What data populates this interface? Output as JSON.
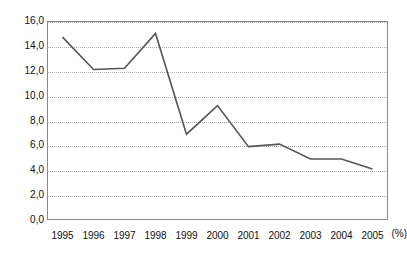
{
  "chart_data": {
    "type": "line",
    "title": "",
    "subtitle": "",
    "xlabel": "",
    "ylabel": "(%)",
    "grid": true,
    "legend": false,
    "legend_position": "none",
    "line_color": "#555555",
    "gridline_color": "#b0b0b0",
    "frame_color": "#8a8a8a",
    "categories": [
      "1995",
      "1996",
      "1997",
      "1998",
      "1999",
      "2000",
      "2001",
      "2002",
      "2003",
      "2004",
      "2005"
    ],
    "x": [
      1995,
      1996,
      1997,
      1998,
      1999,
      2000,
      2001,
      2002,
      2003,
      2004,
      2005
    ],
    "series": [
      {
        "name": "",
        "values": [
          14.7,
          12.1,
          12.2,
          15.0,
          6.9,
          9.2,
          5.9,
          6.1,
          4.9,
          4.9,
          4.1
        ]
      }
    ],
    "ylim": [
      0.0,
      16.0
    ],
    "ytick_values": [
      16.0,
      14.0,
      12.0,
      10.0,
      8.0,
      6.0,
      4.0,
      2.0,
      0.0
    ],
    "ytick_labels": [
      "16,0",
      "14,0",
      "12,0",
      "10,0",
      "8,0",
      "6,0",
      "4,0",
      "2,0",
      "0,0"
    ],
    "y_unit_label": "(%)",
    "annotations": []
  }
}
